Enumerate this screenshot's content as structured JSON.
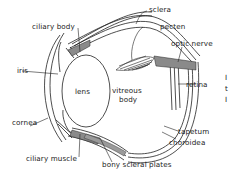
{
  "diagram": {
    "labels": {
      "ciliary_body": "ciliary body",
      "sclera": "sclera",
      "pecten": "pecten",
      "optic_nerve": "optic nerve",
      "iris": "iris",
      "lens": "lens",
      "vitreous_body_line1": "vitreous",
      "vitreous_body_line2": "body",
      "retina": "retina",
      "cornea": "cornea",
      "tapetum": "tapetum",
      "choroidea": "choroidea",
      "ciliary_muscle": "ciliary muscle",
      "bony_scleral_plates": "bony scleral plates"
    },
    "edge_fragments": [
      "I",
      "t",
      "I"
    ],
    "colors": {
      "ink": "#222222",
      "shading": "#8a8a8a",
      "background": "#ffffff"
    }
  }
}
